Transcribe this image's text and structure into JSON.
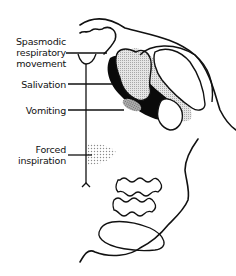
{
  "diagram": {
    "labels": [
      {
        "id": "spasmodic",
        "lines": [
          "Spasmodic",
          "respiratory",
          "movement"
        ]
      },
      {
        "id": "salivation",
        "lines": [
          "Salivation"
        ]
      },
      {
        "id": "vomiting",
        "lines": [
          "Vomiting"
        ]
      },
      {
        "id": "forced",
        "lines": [
          "Forced",
          "inspiration"
        ]
      }
    ],
    "colors": {
      "outline": "#111111",
      "solid_region": "#0a0a0a",
      "stipple_light": "#bdbdbd",
      "stipple_dark": "#8a8a8a",
      "dots": "#9a9a9a"
    }
  }
}
